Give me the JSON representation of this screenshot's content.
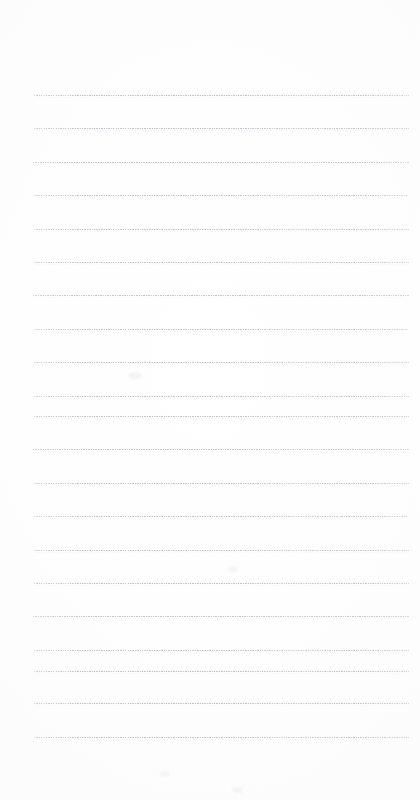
{
  "document": {
    "type": "scanned-lined-notepad-page",
    "title": "Blank ruled notepad page",
    "page_width": 420,
    "page_height": 800,
    "background_color": "#ffffff",
    "rule_color": "#c4c4cc",
    "rule_echo_color": "#e2e2e8",
    "has_text_content": false,
    "handwriting_present": false,
    "printed_text_present": false,
    "margins": {
      "top": 95,
      "bottom": 62,
      "left": 34,
      "right": 11
    },
    "ruling": {
      "count": 21,
      "first_line_y": 95,
      "spacing": 33.5,
      "line_start_x": 34,
      "line_end_x": 409,
      "style": "dotted-faint",
      "thickness": 1
    },
    "rule_lines": [
      {
        "index": 1,
        "y": 95,
        "x1": 34,
        "x2": 409
      },
      {
        "index": 2,
        "y": 128,
        "x1": 34,
        "x2": 409
      },
      {
        "index": 3,
        "y": 162,
        "x1": 33,
        "x2": 409
      },
      {
        "index": 4,
        "y": 195,
        "x1": 34,
        "x2": 408
      },
      {
        "index": 5,
        "y": 229,
        "x1": 34,
        "x2": 409
      },
      {
        "index": 6,
        "y": 262,
        "x1": 34,
        "x2": 409
      },
      {
        "index": 7,
        "y": 295,
        "x1": 33,
        "x2": 409
      },
      {
        "index": 8,
        "y": 329,
        "x1": 34,
        "x2": 408
      },
      {
        "index": 9,
        "y": 362,
        "x1": 34,
        "x2": 409
      },
      {
        "index": 10,
        "y": 396,
        "x1": 34,
        "x2": 409
      },
      {
        "index": 11,
        "y": 416,
        "x1": 34,
        "x2": 409
      },
      {
        "index": 12,
        "y": 449,
        "x1": 33,
        "x2": 409
      },
      {
        "index": 13,
        "y": 483,
        "x1": 34,
        "x2": 409
      },
      {
        "index": 14,
        "y": 516,
        "x1": 34,
        "x2": 408
      },
      {
        "index": 15,
        "y": 550,
        "x1": 34,
        "x2": 409
      },
      {
        "index": 16,
        "y": 583,
        "x1": 34,
        "x2": 409
      },
      {
        "index": 17,
        "y": 616,
        "x1": 33,
        "x2": 409
      },
      {
        "index": 18,
        "y": 650,
        "x1": 34,
        "x2": 409
      },
      {
        "index": 19,
        "y": 671,
        "x1": 34,
        "x2": 409
      },
      {
        "index": 20,
        "y": 703,
        "x1": 34,
        "x2": 409
      },
      {
        "index": 21,
        "y": 737,
        "x1": 34,
        "x2": 409
      }
    ],
    "artifacts": [
      {
        "name": "scan-smudge-upper-left",
        "x": 128,
        "y": 372,
        "w": 14,
        "h": 7
      },
      {
        "name": "scan-smudge-mid",
        "x": 228,
        "y": 566,
        "w": 10,
        "h": 6
      },
      {
        "name": "scan-smudge-lower",
        "x": 160,
        "y": 771,
        "w": 9,
        "h": 5
      },
      {
        "name": "scan-smudge-lower-right",
        "x": 232,
        "y": 787,
        "w": 11,
        "h": 6
      }
    ]
  }
}
